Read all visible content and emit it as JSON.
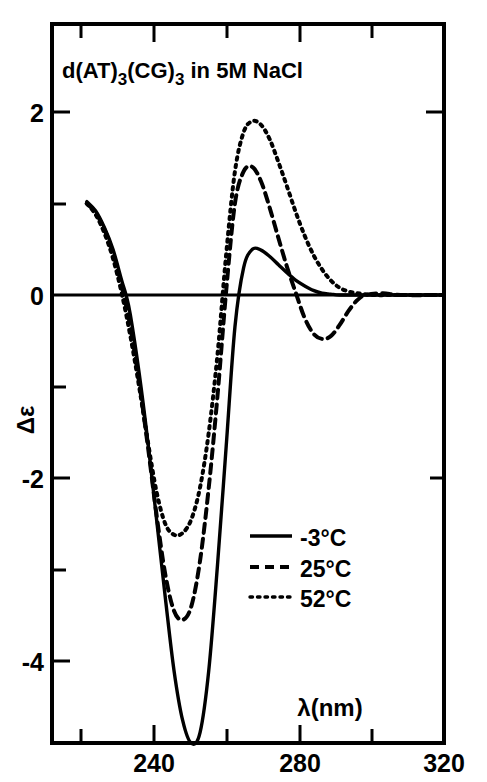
{
  "figure": {
    "title_main_1": "d(AT)",
    "title_sub_1": "3",
    "title_main_2": "(CG)",
    "title_sub_2": "3",
    "title_main_3": " in 5M NaCl",
    "title_full": "d(AT)3(CG)3 in 5M NaCl"
  },
  "axes": {
    "x_label": "λ(nm)",
    "y_label": "Δε",
    "x_ticks_major": [
      "240",
      "280",
      "320"
    ],
    "y_ticks_major": [
      "2",
      "0",
      "-2",
      "-4"
    ]
  },
  "legend": {
    "items": [
      {
        "label": "-3°C",
        "style": "solid"
      },
      {
        "label": "25°C",
        "style": "dashed"
      },
      {
        "label": "52°C",
        "style": "dotted"
      }
    ]
  },
  "chart_data": {
    "type": "line",
    "title": "d(AT)3(CG)3 in 5M NaCl",
    "xlabel": "λ(nm)",
    "ylabel": "Δε",
    "xlim": [
      230,
      320
    ],
    "ylim": [
      -4.9,
      2.9
    ],
    "xticks": [
      240,
      280,
      320
    ],
    "xticks_minor": [
      230,
      250,
      260,
      270,
      290,
      300,
      310
    ],
    "yticks": [
      2,
      0,
      -2,
      -4
    ],
    "yticks_minor": [
      1,
      -1,
      -3
    ],
    "grid": false,
    "legend_position": "center-right",
    "series": [
      {
        "name": "-3°C",
        "style": "solid",
        "x": [
          238,
          240,
          242,
          244,
          246,
          247,
          248,
          250,
          252,
          254,
          256,
          258,
          260,
          262,
          264,
          266,
          268,
          270,
          272,
          274,
          276,
          278,
          280,
          282,
          284,
          286,
          288,
          290,
          292,
          294,
          296,
          300,
          310,
          320
        ],
        "y": [
          1.02,
          0.92,
          0.74,
          0.5,
          0.16,
          0.0,
          -0.22,
          -0.85,
          -1.6,
          -2.45,
          -3.3,
          -4.1,
          -4.65,
          -4.9,
          -4.78,
          -4.1,
          -2.95,
          -1.65,
          -0.35,
          0.3,
          0.5,
          0.49,
          0.42,
          0.33,
          0.24,
          0.16,
          0.1,
          0.05,
          0.02,
          0.01,
          0.0,
          0.0,
          0.0,
          0.0
        ]
      },
      {
        "name": "25°C",
        "style": "dashed",
        "x": [
          238,
          240,
          242,
          244,
          246,
          248,
          250,
          252,
          254,
          256,
          258,
          260,
          262,
          264,
          266,
          268,
          270,
          272,
          274,
          276,
          278,
          280,
          282,
          284,
          286,
          288,
          290,
          292,
          294,
          296,
          298,
          300,
          302,
          306,
          310,
          320
        ],
        "y": [
          1.0,
          0.9,
          0.72,
          0.46,
          0.1,
          -0.35,
          -0.95,
          -1.65,
          -2.4,
          -3.05,
          -3.45,
          -3.55,
          -3.4,
          -2.9,
          -2.1,
          -1.1,
          0.05,
          1.0,
          1.35,
          1.4,
          1.24,
          0.95,
          0.62,
          0.3,
          0.02,
          -0.25,
          -0.42,
          -0.48,
          -0.45,
          -0.33,
          -0.18,
          -0.06,
          0.0,
          0.02,
          0.0,
          0.0
        ]
      },
      {
        "name": "52°C",
        "style": "dotted",
        "x": [
          238,
          240,
          242,
          244,
          246,
          248,
          250,
          252,
          254,
          256,
          258,
          260,
          262,
          264,
          266,
          268,
          270,
          272,
          274,
          276,
          278,
          280,
          282,
          284,
          286,
          288,
          290,
          292,
          294,
          296,
          298,
          300,
          304,
          310,
          320
        ],
        "y": [
          1.0,
          0.88,
          0.68,
          0.4,
          0.02,
          -0.45,
          -1.0,
          -1.6,
          -2.15,
          -2.5,
          -2.62,
          -2.6,
          -2.45,
          -2.1,
          -1.5,
          -0.65,
          0.45,
          1.35,
          1.78,
          1.9,
          1.86,
          1.7,
          1.45,
          1.18,
          0.9,
          0.65,
          0.44,
          0.28,
          0.16,
          0.08,
          0.04,
          0.02,
          0.0,
          0.0,
          0.0
        ]
      }
    ]
  }
}
